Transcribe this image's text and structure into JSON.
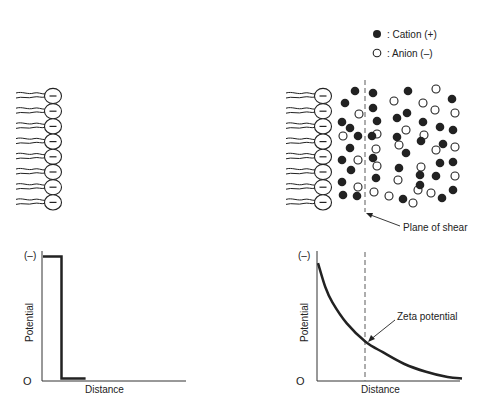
{
  "legend": {
    "cation_label": ": Cation (+)",
    "anion_label": ": Anion (–)"
  },
  "membrane": {
    "head_count": 8,
    "head_sign": "–"
  },
  "top_right": {
    "shear_label": "Plane of shear"
  },
  "charts": [
    {
      "id": "left",
      "y_top_label": "(–)",
      "y_zero_label": "O",
      "ylabel": "Potential",
      "xlabel": "Distance"
    },
    {
      "id": "right",
      "y_top_label": "(–)",
      "y_zero_label": "O",
      "ylabel": "Potential",
      "xlabel": "Distance",
      "annotation": "Zeta potential"
    }
  ],
  "chart_data": [
    {
      "type": "line",
      "title": "",
      "xlabel": "Distance",
      "ylabel": "Potential",
      "y_top_tick": "(–)",
      "y_zero_tick": "O",
      "x": [
        0,
        0.13,
        0.13,
        0.3
      ],
      "y": [
        0.95,
        0.95,
        0.02,
        0.02
      ],
      "xlim": [
        0,
        1
      ],
      "ylim": [
        0,
        1
      ],
      "description": "Step potential: constant negative potential at membrane, drops abruptly to zero"
    },
    {
      "type": "line",
      "title": "",
      "xlabel": "Distance",
      "ylabel": "Potential",
      "y_top_tick": "(–)",
      "y_zero_tick": "O",
      "x": [
        0,
        0.05,
        0.1,
        0.2,
        0.33,
        0.45,
        0.6,
        0.75,
        0.9,
        1.0
      ],
      "y": [
        0.9,
        0.72,
        0.6,
        0.44,
        0.3,
        0.22,
        0.13,
        0.07,
        0.03,
        0.02
      ],
      "xlim": [
        0,
        1
      ],
      "ylim": [
        0,
        1
      ],
      "annotations": [
        {
          "text": "Zeta potential",
          "x": 0.33,
          "y": 0.3
        }
      ],
      "vertical_dashed_line_x": 0.33,
      "description": "Exponential decay of potential with distance; zeta potential at plane of shear"
    }
  ]
}
